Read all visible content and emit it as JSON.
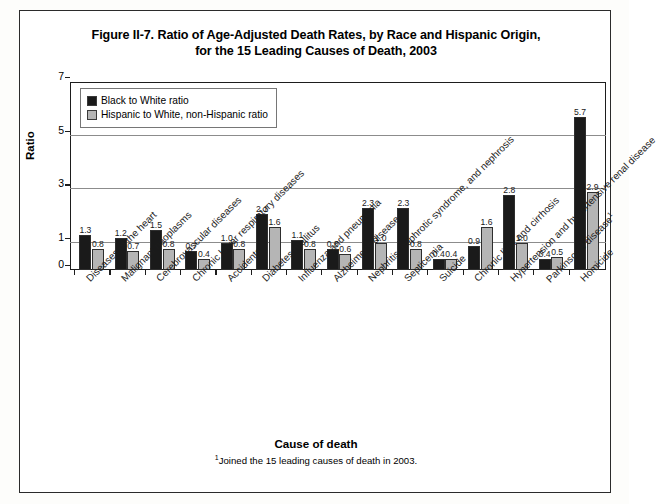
{
  "figure": {
    "title_line1": "Figure II-7. Ratio of Age-Adjusted Death Rates, by Race and Hispanic Origin,",
    "title_line2": "for the 15 Leading Causes of Death, 2003",
    "xaxis_title": "Cause of death",
    "footnote_marker": "1",
    "footnote_text": "Joined the 15 leading causes of death in 2003."
  },
  "legend": {
    "entries": [
      {
        "label": "Black to White ratio",
        "color": "#1a1a1a"
      },
      {
        "label": "Hispanic to White, non-Hispanic ratio",
        "color": "#b5b5b5"
      }
    ]
  },
  "chart_data": {
    "type": "bar",
    "title": "Figure II-7. Ratio of Age-Adjusted Death Rates, by Race and Hispanic Origin, for the 15 Leading Causes of Death, 2003",
    "xlabel": "Cause of death",
    "ylabel": "Ratio",
    "ylim": [
      0,
      7
    ],
    "yticks": [
      0,
      1,
      3,
      5,
      7
    ],
    "gridlines": [
      1,
      3,
      5
    ],
    "grid": true,
    "legend_position": "top-left-inside",
    "categories": [
      "Diseases of the heart",
      "Malignant neoplasms",
      "Cerebrovascular diseases",
      "Chronic lower respiratory diseases",
      "Accidents",
      "Diabetes mellitus",
      "Influenza and pneumonia",
      "Alzheimer's disease",
      "Nephritis, nephrotic syndrome, and nephrosis",
      "Septicemia",
      "Suicide",
      "Chronic liver and cirrhosis",
      "Hypertension and hypertensive renal disease",
      "Parkinson's disease",
      "Homicide"
    ],
    "category_footnotes": [
      "",
      "",
      "",
      "",
      "",
      "",
      "",
      "",
      "",
      "",
      "",
      "",
      "",
      "1",
      ""
    ],
    "series": [
      {
        "name": "Black to White ratio",
        "color": "#1a1a1a",
        "values": [
          1.3,
          1.2,
          1.5,
          0.7,
          1.0,
          2.1,
          1.1,
          0.8,
          2.3,
          2.3,
          0.4,
          0.9,
          2.8,
          0.4,
          5.7
        ],
        "labels": [
          "1.3",
          "1.2",
          "1.5",
          "0.7",
          "1.0",
          "2.1",
          "1.1",
          "0.8",
          "2.3",
          "2.3",
          "0.4",
          "0.9",
          "2.8",
          "0.4",
          "5.7"
        ]
      },
      {
        "name": "Hispanic to White, non-Hispanic ratio",
        "color": "#b5b5b5",
        "values": [
          0.8,
          0.7,
          0.8,
          0.4,
          0.8,
          1.6,
          0.8,
          0.6,
          1.0,
          0.8,
          0.4,
          1.6,
          1.0,
          0.5,
          2.9
        ],
        "labels": [
          "0.8",
          "0.7",
          "0.8",
          "0.4",
          "0.8",
          "1.6",
          "0.8",
          "0.6",
          "1.0",
          "0.8",
          "0.4",
          "1.6",
          "1.0",
          "0.5",
          "2.9"
        ]
      }
    ]
  }
}
